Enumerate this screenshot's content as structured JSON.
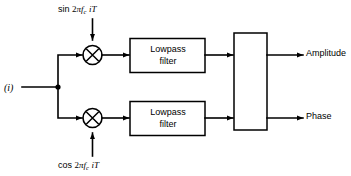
{
  "diagram": {
    "type": "signal-flow-block-diagram",
    "background_color": "#ffffff",
    "line_color": "#000000"
  },
  "inputs": {
    "signal": {
      "label": "(i)",
      "name": "input-signal"
    },
    "carrier_sin": {
      "function": "sin",
      "coefficient": "2",
      "greek": "π",
      "variable": "f",
      "subscript": "c",
      "index": "i",
      "period": "T",
      "full_text": "sin 2πf_c iT"
    },
    "carrier_cos": {
      "function": "cos",
      "coefficient": "2",
      "greek": "π",
      "variable": "f",
      "subscript": "c",
      "index": "i",
      "period": "T",
      "full_text": "cos 2πf_c iT"
    }
  },
  "blocks": {
    "mixer_top": {
      "name": "mixer-multiplier-top",
      "symbol": "circle-with-cross"
    },
    "mixer_bottom": {
      "name": "mixer-multiplier-bottom",
      "symbol": "circle-with-cross"
    },
    "filter_top": {
      "line1": "Lowpass",
      "line2": "filter"
    },
    "filter_bottom": {
      "line1": "Lowpass",
      "line2": "filter"
    },
    "combiner": {
      "name": "combiner-block",
      "label": ""
    }
  },
  "outputs": {
    "amplitude": {
      "label": "Amplitude"
    },
    "phase": {
      "label": "Phase"
    }
  }
}
